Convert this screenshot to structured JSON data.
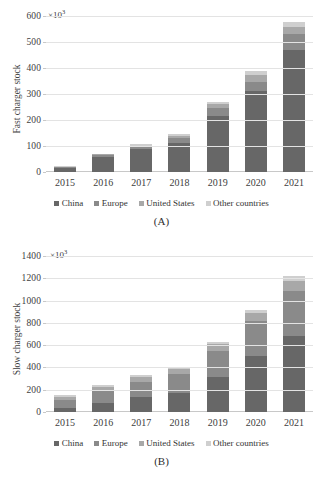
{
  "palette": {
    "china": "#676767",
    "europe": "#8a8a8a",
    "united_states": "#a8a8a8",
    "other_countries": "#cfcfcf",
    "gridline": "#e3e3e3",
    "axis": "#c8c8c8",
    "text": "#3d3d3d"
  },
  "legend": {
    "items": [
      {
        "label": "China",
        "color": "#676767",
        "swatch_name": "legend-swatch-china"
      },
      {
        "label": "Europe",
        "color": "#8a8a8a",
        "swatch_name": "legend-swatch-europe"
      },
      {
        "label": "United States",
        "color": "#a8a8a8",
        "swatch_name": "legend-swatch-united-states"
      },
      {
        "label": "Other countries",
        "color": "#cfcfcf",
        "swatch_name": "legend-swatch-other-countries"
      }
    ]
  },
  "figure_a": {
    "caption": "(A)",
    "exponent_label": "×10",
    "exponent_power": "3",
    "ylabel": "Fast charger stock",
    "yticks": [
      "0",
      "100",
      "200",
      "300",
      "400",
      "500",
      "600"
    ],
    "xticks": [
      "2015",
      "2016",
      "2017",
      "2018",
      "2019",
      "2020",
      "2021"
    ]
  },
  "figure_b": {
    "caption": "(B)",
    "exponent_label": "×10",
    "exponent_power": "3",
    "ylabel": "Slow charger stock",
    "yticks": [
      "0",
      "200",
      "400",
      "600",
      "800",
      "1000",
      "1200",
      "1400"
    ],
    "xticks": [
      "2015",
      "2016",
      "2017",
      "2018",
      "2019",
      "2020",
      "2021"
    ]
  },
  "chart_data": [
    {
      "type": "bar",
      "id": "fast-charger-stock",
      "panel": "(A)",
      "stacked": true,
      "title": "",
      "xlabel": "",
      "ylabel": "Fast charger stock",
      "y_unit": "×10^3",
      "ylim": [
        0,
        600
      ],
      "ytick_step": 100,
      "grid": true,
      "legend_position": "bottom",
      "categories": [
        "2015",
        "2016",
        "2017",
        "2018",
        "2019",
        "2020",
        "2021"
      ],
      "series": [
        {
          "name": "China",
          "color": "#676767",
          "values": [
            14,
            59,
            87,
            113,
            215,
            310,
            471
          ]
        },
        {
          "name": "Europe",
          "color": "#8a8a8a",
          "values": [
            4,
            6,
            9,
            16,
            30,
            38,
            58
          ]
        },
        {
          "name": "United States",
          "color": "#a8a8a8",
          "values": [
            3,
            4,
            6,
            10,
            17,
            26,
            30
          ]
        },
        {
          "name": "Other countries",
          "color": "#cfcfcf",
          "values": [
            1,
            2,
            4,
            6,
            9,
            14,
            18
          ]
        }
      ],
      "totals": [
        22,
        71,
        106,
        145,
        271,
        388,
        577
      ]
    },
    {
      "type": "bar",
      "id": "slow-charger-stock",
      "panel": "(B)",
      "stacked": true,
      "title": "",
      "xlabel": "",
      "ylabel": "Slow charger stock",
      "y_unit": "×10^3",
      "ylim": [
        0,
        1400
      ],
      "ytick_step": 200,
      "grid": true,
      "legend_position": "bottom",
      "categories": [
        "2015",
        "2016",
        "2017",
        "2018",
        "2019",
        "2020",
        "2021"
      ],
      "series": [
        {
          "name": "China",
          "color": "#676767",
          "values": [
            40,
            82,
            132,
            170,
            312,
            500,
            680
          ]
        },
        {
          "name": "Europe",
          "color": "#8a8a8a",
          "values": [
            65,
            105,
            135,
            175,
            240,
            320,
            410
          ]
        },
        {
          "name": "United States",
          "color": "#a8a8a8",
          "values": [
            30,
            40,
            45,
            40,
            55,
            70,
            90
          ]
        },
        {
          "name": "Other countries",
          "color": "#cfcfcf",
          "values": [
            15,
            18,
            20,
            22,
            25,
            30,
            45
          ]
        }
      ],
      "totals": [
        150,
        245,
        332,
        407,
        632,
        920,
        1225
      ]
    }
  ]
}
